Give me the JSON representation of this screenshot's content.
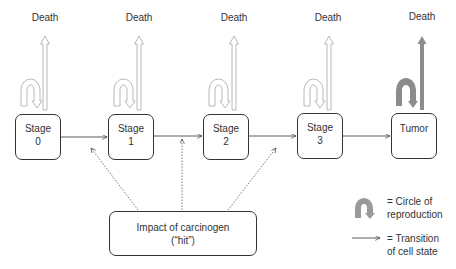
{
  "diagram": {
    "death_label": "Death",
    "stages": [
      {
        "line1": "Stage",
        "line2": "0"
      },
      {
        "line1": "Stage",
        "line2": "1"
      },
      {
        "line1": "Stage",
        "line2": "2"
      },
      {
        "line1": "Stage",
        "line2": "3"
      },
      {
        "line1": "Tumor",
        "line2": ""
      }
    ],
    "deaths": [
      "Death",
      "Death",
      "Death",
      "Death",
      "Death"
    ],
    "impact": {
      "line1": "Impact of carcinogen",
      "line2": "(“hit”)"
    },
    "legend": {
      "reproduction": {
        "line1": "= Circle of",
        "line2": "reproduction"
      },
      "transition": {
        "line1": "= Transition",
        "line2": "of cell state"
      }
    },
    "colors": {
      "outline_arrow": "#b5b5b5",
      "tumor_arrow": "#8c8c8c",
      "box_border": "#333333",
      "dotted": "#666666"
    }
  }
}
